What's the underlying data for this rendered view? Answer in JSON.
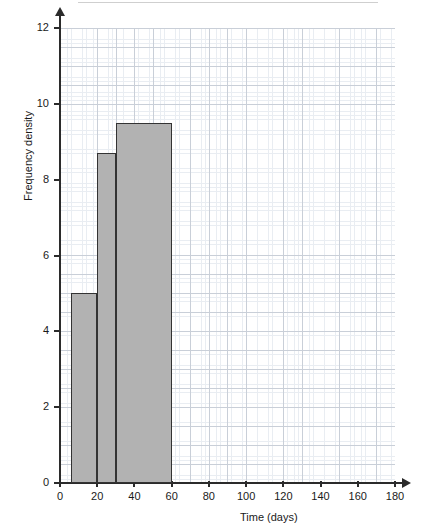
{
  "chart_data": {
    "type": "bar",
    "subtype": "histogram",
    "title": "",
    "xlabel": "Time (days)",
    "ylabel": "Frequency density",
    "xlim": [
      0,
      180
    ],
    "ylim": [
      0,
      12
    ],
    "x_ticks": [
      0,
      20,
      40,
      60,
      80,
      100,
      120,
      140,
      160,
      180
    ],
    "x_tick_labels": [
      "0",
      "20",
      "40",
      "60",
      "80",
      "100",
      "120",
      "140",
      "160",
      "180"
    ],
    "y_ticks": [
      0,
      2,
      4,
      6,
      8,
      10,
      12
    ],
    "y_tick_labels": [
      "0",
      "2",
      "4",
      "6",
      "8",
      "10",
      "12"
    ],
    "grid": true,
    "grid_major_x_step": 10,
    "grid_major_y_step": 0.5,
    "grid_minor_x_step": 2,
    "grid_minor_y_step": 0.1,
    "legend": null,
    "bar_fill_color": "#b2b2b2",
    "bar_edge_color": "#333333",
    "grid_major_color": "#c9cfd8",
    "grid_minor_color": "#e9edf2",
    "axis_color": "#2b2b2b",
    "bins": [
      {
        "label": "6 < t <= 20",
        "x_start": 6,
        "x_end": 20,
        "value": 5.0
      },
      {
        "label": "20 < t <= 30",
        "x_start": 20,
        "x_end": 30,
        "value": 8.7
      },
      {
        "label": "30 < t <= 60",
        "x_start": 30,
        "x_end": 60,
        "value": 9.5
      }
    ],
    "categories": [
      "6-20",
      "20-30",
      "30-60"
    ],
    "values": [
      5.0,
      8.7,
      9.5
    ]
  },
  "axes": {
    "y_title": "Frequency density",
    "x_title": "Time (days)"
  }
}
